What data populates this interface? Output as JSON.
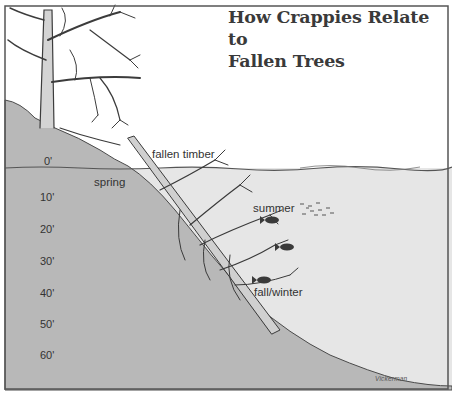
{
  "title": {
    "line1": "How Crappies Relate to",
    "line2": "Fallen Trees"
  },
  "labels": {
    "fallen_timber": "fallen timber",
    "spring": "spring",
    "summer": "summer",
    "fall_winter": "fall/winter",
    "signature": "Vickerman"
  },
  "depth_scale": [
    {
      "label": "0'",
      "y": 160
    },
    {
      "label": "10'",
      "y": 196
    },
    {
      "label": "20'",
      "y": 228
    },
    {
      "label": "30'",
      "y": 260
    },
    {
      "label": "40'",
      "y": 292
    },
    {
      "label": "50'",
      "y": 323
    },
    {
      "label": "60'",
      "y": 354
    }
  ],
  "colors": {
    "ground": "#b4b4b4",
    "water": "#e4e4e4",
    "line": "#444444",
    "frame": "#555555"
  }
}
